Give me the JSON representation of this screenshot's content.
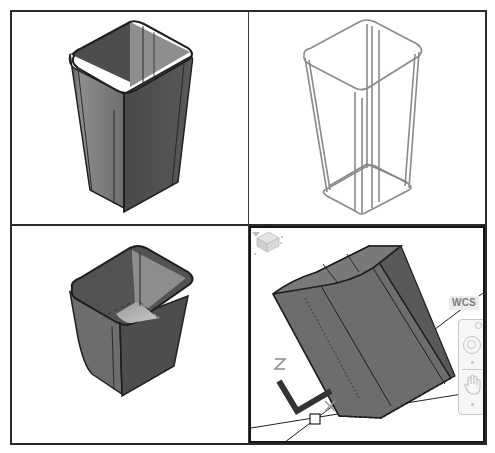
{
  "figure": {
    "layout": "2x2 viewports",
    "viewports": [
      {
        "id": "top-left",
        "label": "Shaded isometric view",
        "visual_style": "shaded",
        "active": false
      },
      {
        "id": "top-right",
        "label": "Wireframe isometric view",
        "visual_style": "wireframe",
        "active": false
      },
      {
        "id": "bottom-left",
        "label": "Shaded view from above",
        "visual_style": "shaded",
        "active": false
      },
      {
        "id": "bottom-right",
        "label": "Active rotated view",
        "visual_style": "shaded",
        "active": true
      }
    ]
  },
  "active_viewport": {
    "ucs_selector": {
      "label": "WCS",
      "icon": "chevron-down-icon"
    },
    "viewcube": {
      "icon": "viewcube-icon"
    },
    "navigation_bar": {
      "items": [
        {
          "name": "steering-wheel",
          "icon": "steering-wheel-icon"
        },
        {
          "name": "pan",
          "icon": "pan-hand-icon"
        }
      ]
    },
    "ucs_icon": {
      "axes": [
        "Z",
        "Y"
      ]
    }
  },
  "colors": {
    "border": "#2b2b2b",
    "shade_dark": "#4a4848",
    "shade_mid": "#6b6969",
    "shade_light": "#9a9898",
    "wire": "#8a8a8a",
    "ui_gray": "#c3c3c3",
    "wcs_text": "#7d7d7d"
  }
}
